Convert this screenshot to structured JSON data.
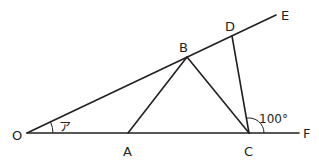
{
  "diagram": {
    "points": {
      "O": {
        "label": "O",
        "x": 27,
        "y": 133
      },
      "A": {
        "label": "A",
        "x": 128,
        "y": 133
      },
      "B": {
        "label": "B",
        "x": 187,
        "y": 57
      },
      "C": {
        "label": "C",
        "x": 249,
        "y": 133
      },
      "D": {
        "label": "D",
        "x": 232,
        "y": 36
      },
      "E": {
        "label": "E",
        "x": 276,
        "y": 15
      },
      "F": {
        "label": "F",
        "x": 299,
        "y": 133
      }
    },
    "labels": {
      "O": "O",
      "A": "A",
      "B": "B",
      "C": "C",
      "D": "D",
      "E": "E",
      "F": "F"
    },
    "angles": {
      "angle_a": {
        "label": "ア",
        "vertex": "O"
      },
      "angle_dcf": {
        "label": "100°",
        "vertex": "C"
      }
    },
    "segments": [
      "OE",
      "OF",
      "AB",
      "BC",
      "DC"
    ]
  }
}
